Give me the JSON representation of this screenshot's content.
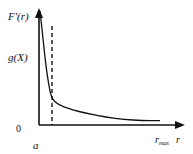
{
  "chart_data": {
    "type": "line",
    "title": "",
    "ylabel_top": "F'(r)",
    "y_marker_label": "g(X)",
    "y_origin_label": "0",
    "x_start_label": "a",
    "x_end_marker_label": "r_max",
    "xlabel": "r",
    "dashed_marker": "vertical dashed line just right of a",
    "series": [
      {
        "name": "F'(r)",
        "description": "steeply decreasing curve starting near top of y-axis at r=a, dropping sharply then decaying slowly toward r_max",
        "x": [
          0,
          0.02,
          0.05,
          0.08,
          0.1,
          0.15,
          0.25,
          0.4,
          0.55,
          0.7,
          0.85,
          1.0
        ],
        "y": [
          0.99,
          0.8,
          0.5,
          0.3,
          0.22,
          0.17,
          0.13,
          0.09,
          0.06,
          0.04,
          0.03,
          0.03
        ]
      }
    ],
    "x_range": [
      "a",
      "r_max"
    ],
    "grid": false,
    "legend": "none"
  },
  "labels": {
    "f_prime": "F'(r)",
    "g_x": "g(X)",
    "zero": "0",
    "a": "a",
    "r_max_base": "r",
    "r_max_sub": "max",
    "r": "r"
  }
}
